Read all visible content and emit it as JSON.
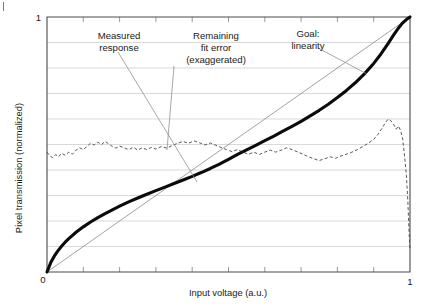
{
  "figure": {
    "corner_mark": "tick-mark"
  },
  "chart_data": {
    "type": "line",
    "title": "",
    "xlabel": "Input voltage (a.u.)",
    "ylabel": "Pixel transmission (normalized)",
    "xlim": [
      0,
      1
    ],
    "ylim": [
      0,
      1
    ],
    "xticklabels": [
      "0",
      "1"
    ],
    "yticklabels": [
      "1",
      "0"
    ],
    "x_tick_count": 10,
    "y_grid_count": 10,
    "grid": "horizontal",
    "legend": "none",
    "annotations": [
      {
        "name": "measured-response",
        "lines": [
          "Measured",
          "response"
        ],
        "points_to": "measured response curve"
      },
      {
        "name": "remaining-fit-error",
        "lines": [
          "Remaining",
          "fit error",
          "(exaggerated)"
        ],
        "points_to": "dashed residual error curve"
      },
      {
        "name": "goal-linearity",
        "lines": [
          "Goal:",
          "linearity"
        ],
        "points_to": "straight diagonal line"
      }
    ],
    "series": [
      {
        "name": "Measured response",
        "style": "thick-solid-black",
        "x": [
          0.0,
          0.01,
          0.02,
          0.03,
          0.04,
          0.05,
          0.06,
          0.08,
          0.1,
          0.12,
          0.14,
          0.16,
          0.18,
          0.2,
          0.225,
          0.25,
          0.275,
          0.3,
          0.325,
          0.35,
          0.375,
          0.4,
          0.425,
          0.45,
          0.475,
          0.5,
          0.525,
          0.55,
          0.575,
          0.6,
          0.625,
          0.65,
          0.675,
          0.7,
          0.725,
          0.75,
          0.775,
          0.8,
          0.825,
          0.85,
          0.875,
          0.9,
          0.92,
          0.94,
          0.955,
          0.97,
          0.98,
          0.99,
          1.0
        ],
        "y": [
          0.0,
          0.036,
          0.062,
          0.083,
          0.101,
          0.117,
          0.131,
          0.156,
          0.177,
          0.196,
          0.213,
          0.229,
          0.244,
          0.258,
          0.275,
          0.29,
          0.305,
          0.319,
          0.333,
          0.347,
          0.361,
          0.375,
          0.39,
          0.406,
          0.423,
          0.442,
          0.461,
          0.479,
          0.497,
          0.515,
          0.533,
          0.552,
          0.571,
          0.591,
          0.612,
          0.634,
          0.658,
          0.684,
          0.712,
          0.743,
          0.778,
          0.818,
          0.855,
          0.897,
          0.93,
          0.96,
          0.977,
          0.99,
          1.0
        ]
      },
      {
        "name": "Goal: linearity",
        "style": "thin-solid-gray",
        "x": [
          0,
          1
        ],
        "y": [
          0,
          1
        ]
      },
      {
        "name": "Remaining fit error (exaggerated)",
        "style": "thin-dashed",
        "x": [
          0.0,
          0.008,
          0.016,
          0.024,
          0.032,
          0.04,
          0.05,
          0.06,
          0.07,
          0.08,
          0.09,
          0.1,
          0.11,
          0.12,
          0.13,
          0.14,
          0.15,
          0.16,
          0.17,
          0.18,
          0.19,
          0.2,
          0.212,
          0.225,
          0.238,
          0.25,
          0.262,
          0.275,
          0.288,
          0.3,
          0.315,
          0.33,
          0.345,
          0.36,
          0.375,
          0.39,
          0.405,
          0.42,
          0.435,
          0.45,
          0.465,
          0.48,
          0.495,
          0.51,
          0.525,
          0.54,
          0.555,
          0.57,
          0.585,
          0.6,
          0.615,
          0.63,
          0.645,
          0.66,
          0.675,
          0.69,
          0.705,
          0.72,
          0.735,
          0.75,
          0.765,
          0.78,
          0.795,
          0.81,
          0.825,
          0.84,
          0.855,
          0.87,
          0.885,
          0.9,
          0.912,
          0.922,
          0.932,
          0.94,
          0.948,
          0.955,
          0.962,
          0.968,
          0.974,
          0.98,
          0.985,
          0.99,
          0.994,
          0.997,
          1.0
        ],
        "y": [
          0.47,
          0.455,
          0.448,
          0.46,
          0.452,
          0.466,
          0.458,
          0.47,
          0.462,
          0.478,
          0.487,
          0.48,
          0.492,
          0.505,
          0.498,
          0.509,
          0.5,
          0.512,
          0.503,
          0.492,
          0.486,
          0.494,
          0.487,
          0.48,
          0.489,
          0.478,
          0.487,
          0.48,
          0.489,
          0.482,
          0.492,
          0.486,
          0.496,
          0.505,
          0.512,
          0.505,
          0.514,
          0.507,
          0.498,
          0.506,
          0.497,
          0.488,
          0.48,
          0.472,
          0.48,
          0.47,
          0.462,
          0.47,
          0.461,
          0.47,
          0.478,
          0.47,
          0.478,
          0.487,
          0.48,
          0.471,
          0.462,
          0.452,
          0.444,
          0.437,
          0.444,
          0.452,
          0.446,
          0.455,
          0.462,
          0.47,
          0.48,
          0.492,
          0.505,
          0.52,
          0.54,
          0.562,
          0.585,
          0.6,
          0.592,
          0.578,
          0.56,
          0.572,
          0.556,
          0.52,
          0.455,
          0.38,
          0.28,
          0.17,
          0.09
        ]
      }
    ]
  }
}
